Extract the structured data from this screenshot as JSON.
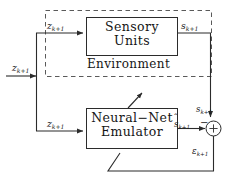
{
  "figure": {
    "type": "block-diagram",
    "background": "#ffffff",
    "line_color": "#2b2b2b"
  },
  "blocks": {
    "environment": {
      "label": "Environment",
      "border_style": "dashed",
      "name": "environment-group"
    },
    "sensory_units": {
      "line1": "Sensory",
      "line2": "Units",
      "border_style": "solid"
    },
    "emulator": {
      "line1": "Neural−Net",
      "line2": "Emulator",
      "border_style": "solid"
    }
  },
  "signals": {
    "external_input": {
      "base": "z",
      "sub": "k+1",
      "text": "z k+1"
    },
    "sensory_input": {
      "base": "z",
      "sub": "k+1",
      "text": "z k+1"
    },
    "emulator_input": {
      "base": "z",
      "sub": "k+1",
      "text": "z k+1"
    },
    "sensory_output": {
      "base": "s",
      "sub": "k+1",
      "text": "s k+1"
    },
    "sum_input_actual": {
      "base": "s",
      "sub": "k+1",
      "text": "s k+1"
    },
    "emulator_output": {
      "base": "s",
      "sub": "k+1",
      "hat": "ˆ",
      "text": "ŝ k+1"
    },
    "error": {
      "base": "ε",
      "sub": "k+1",
      "text": "ε k+1"
    }
  },
  "summing_junction": {
    "name": "summing-junction",
    "glyph": "+",
    "negative_marker": "−"
  }
}
